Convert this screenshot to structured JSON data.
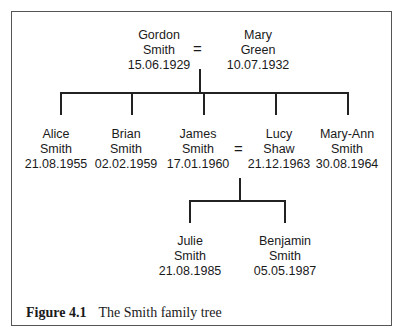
{
  "title": "Smith family tree",
  "generation1": [
    {
      "first": "Gordon",
      "last": "Smith",
      "dob": "15.06.1929"
    },
    {
      "first": "Mary",
      "last": "Green",
      "dob": "10.07.1932"
    }
  ],
  "generation2": [
    {
      "first": "Alice",
      "last": "Smith",
      "dob": "21.08.1955"
    },
    {
      "first": "Brian",
      "last": "Smith",
      "dob": "02.02.1959"
    },
    {
      "first": "James",
      "last": "Smith",
      "dob": "17.01.1960"
    },
    {
      "first": "Lucy",
      "last": "Shaw",
      "dob": "21.12.1963"
    },
    {
      "first": "Mary-Ann",
      "last": "Smith",
      "dob": "30.08.1964"
    }
  ],
  "generation3": [
    {
      "first": "Julie",
      "last": "Smith",
      "dob": "21.08.1985"
    },
    {
      "first": "Benjamin",
      "last": "Smith",
      "dob": "05.05.1987"
    }
  ],
  "marriage_symbol": "=",
  "caption": {
    "label": "Figure 4.1",
    "text": "The Smith family tree"
  }
}
